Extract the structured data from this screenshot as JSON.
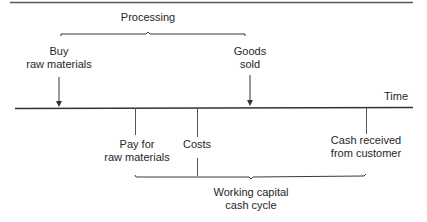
{
  "diagram": {
    "type": "timeline",
    "axis_label": "Time",
    "top_bracket": {
      "label": "Processing"
    },
    "events_above": [
      {
        "line1": "Buy",
        "line2": "raw materials"
      },
      {
        "line1": "Goods",
        "line2": "sold"
      }
    ],
    "events_below": [
      {
        "line1": "Pay for",
        "line2": "raw materials"
      },
      {
        "line1": "Costs",
        "line2": ""
      },
      {
        "line1": "Cash received",
        "line2": "from customer"
      }
    ],
    "bottom_bracket": {
      "line1": "Working capital",
      "line2": "cash cycle"
    },
    "colors": {
      "line": "#3a3a3a",
      "background": "#ffffff"
    }
  }
}
